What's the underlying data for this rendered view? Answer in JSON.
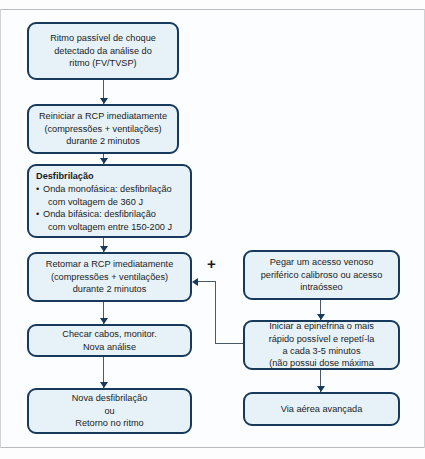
{
  "diagram": {
    "title_hidden": "",
    "colors": {
      "node_fill": "#e7f2f8",
      "node_border": "#17395c",
      "connector": "#4a5a66",
      "background": "#fbfdfe",
      "frame_line": "#b9bcbd"
    },
    "nodes": {
      "rhythm_detect": {
        "lines": [
          "Ritmo passível de choque",
          "detectado da análise do",
          "ritmo (FV/TVSP)"
        ]
      },
      "restart_cpr": {
        "lines": [
          "Reiniciar a RCP imediatamente",
          "(compressões + ventilações)",
          "durante 2 minutos"
        ]
      },
      "defibrillation": {
        "heading": "Desfibrilação",
        "items": [
          {
            "bullet": "Onda monofásica: desfibrilação",
            "cont": "com voltagem de 360 J"
          },
          {
            "bullet": "Onda bifásica: desfibrilação",
            "cont": "com voltagem entre 150-200 J"
          }
        ]
      },
      "resume_cpr": {
        "lines": [
          "Retomar a RCP imediatamente",
          "(compressões + ventilações)",
          "durante 2 minutos"
        ]
      },
      "check_cables": {
        "lines": [
          "Checar cabos, monitor.",
          "Nova análise"
        ]
      },
      "new_defib": {
        "lines": [
          "Nova desfibrilação",
          "ou",
          "Retorno no ritmo"
        ]
      },
      "venous_access": {
        "lines": [
          "Pegar um acesso venoso",
          "periférico calibroso ou acesso",
          "intraósseo"
        ]
      },
      "epinephrine": {
        "lines": [
          "Iniciar a epinefrina o mais",
          "rápido possível e repetí-la",
          "a cada 3-5 minutos",
          "(não possui dose máxima"
        ]
      },
      "advanced_airway": {
        "lines": [
          "Via aérea avançada"
        ]
      }
    },
    "connectors": {
      "plus_label": "+"
    }
  }
}
